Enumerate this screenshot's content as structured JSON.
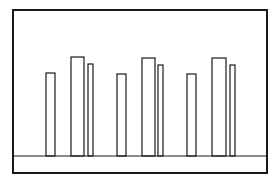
{
  "colors": {
    "background": "#ffffff",
    "stroke": "#1a1a1a",
    "bar_fill": "#ffffff"
  },
  "frame": {
    "x": 13,
    "y": 10,
    "width": 254,
    "height": 163,
    "stroke_width": 2
  },
  "baseline": {
    "y": 156,
    "stroke_width": 1.2
  },
  "chart_data": {
    "type": "bar",
    "title": "",
    "xlabel": "",
    "ylabel": "",
    "categories": [
      "Group 1",
      "Group 2",
      "Group 3"
    ],
    "series": [
      {
        "name": "Bar A (short)",
        "values": [
          83,
          82,
          82
        ]
      },
      {
        "name": "Bar B (tall)",
        "values": [
          99,
          98,
          98
        ]
      },
      {
        "name": "Bar C (narrow)",
        "values": [
          92,
          91,
          91
        ]
      }
    ],
    "note": "values = bar heights in pixels above baseline; no axis ticks or labels visible",
    "grid": false,
    "legend": "none"
  },
  "bars": [
    {
      "x": 46,
      "top": 73,
      "w": 9
    },
    {
      "x": 71,
      "top": 57,
      "w": 13
    },
    {
      "x": 88,
      "top": 64,
      "w": 5
    },
    {
      "x": 117,
      "top": 74,
      "w": 9
    },
    {
      "x": 142,
      "top": 58,
      "w": 13
    },
    {
      "x": 158,
      "top": 65,
      "w": 5
    },
    {
      "x": 187,
      "top": 74,
      "w": 9
    },
    {
      "x": 212,
      "top": 58,
      "w": 14
    },
    {
      "x": 230,
      "top": 65,
      "w": 5
    }
  ]
}
